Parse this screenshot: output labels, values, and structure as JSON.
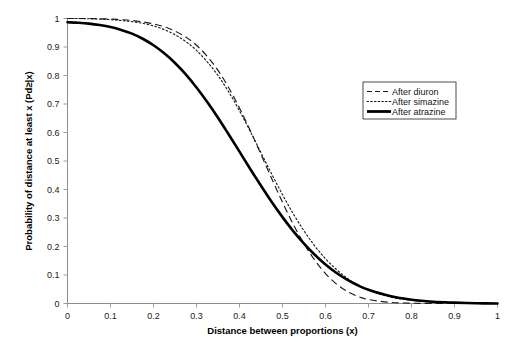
{
  "chart_data": {
    "type": "line",
    "title": "",
    "subtitle": "",
    "xlabel": "Distance between proportions (x)",
    "ylabel": "Probability of distance at least x (Pd≥|x)",
    "xlim": [
      0,
      1
    ],
    "ylim": [
      0,
      1
    ],
    "grid": false,
    "legend_position": "upper-right",
    "xticks": [
      "0",
      "0.1",
      "0.2",
      "0.3",
      "0.4",
      "0.5",
      "0.6",
      "0.7",
      "0.8",
      "0.9",
      "1"
    ],
    "xtick_values": [
      0,
      0.1,
      0.2,
      0.3,
      0.4,
      0.5,
      0.6,
      0.7,
      0.8,
      0.9,
      1
    ],
    "yticks": [
      "0",
      "0.1",
      "0.2",
      "0.3",
      "0.4",
      "0.5",
      "0.6",
      "0.7",
      "0.8",
      "0.9",
      "1"
    ],
    "ytick_values": [
      0,
      0.1,
      0.2,
      0.3,
      0.4,
      0.5,
      0.6,
      0.7,
      0.8,
      0.9,
      1
    ],
    "x": [
      0,
      0.025,
      0.05,
      0.075,
      0.1,
      0.125,
      0.15,
      0.175,
      0.2,
      0.225,
      0.25,
      0.275,
      0.3,
      0.325,
      0.35,
      0.375,
      0.4,
      0.425,
      0.45,
      0.475,
      0.5,
      0.525,
      0.55,
      0.575,
      0.6,
      0.625,
      0.65,
      0.675,
      0.7,
      0.75,
      0.8,
      0.85,
      0.9,
      0.95,
      1
    ],
    "series": [
      {
        "name": "After diuron",
        "style": "dashed",
        "color": "#1b1b1b",
        "values": [
          1.0,
          1.0,
          1.0,
          0.999,
          0.998,
          0.996,
          0.993,
          0.988,
          0.981,
          0.971,
          0.956,
          0.935,
          0.906,
          0.867,
          0.818,
          0.757,
          0.686,
          0.607,
          0.523,
          0.438,
          0.355,
          0.278,
          0.21,
          0.152,
          0.105,
          0.069,
          0.043,
          0.025,
          0.014,
          0.004,
          0.001,
          0.0,
          0.0,
          0.0,
          0.0
        ]
      },
      {
        "name": "After simazine",
        "style": "dotted",
        "color": "#1b1b1b",
        "values": [
          1.0,
          1.0,
          0.999,
          0.998,
          0.996,
          0.993,
          0.989,
          0.983,
          0.974,
          0.961,
          0.943,
          0.919,
          0.888,
          0.848,
          0.8,
          0.742,
          0.676,
          0.604,
          0.529,
          0.454,
          0.382,
          0.315,
          0.255,
          0.202,
          0.157,
          0.12,
          0.089,
          0.065,
          0.047,
          0.023,
          0.011,
          0.005,
          0.002,
          0.001,
          0.0
        ]
      },
      {
        "name": "After atrazine",
        "style": "solid",
        "color": "#000000",
        "values": [
          0.987,
          0.985,
          0.982,
          0.977,
          0.97,
          0.96,
          0.947,
          0.929,
          0.906,
          0.878,
          0.844,
          0.804,
          0.758,
          0.707,
          0.652,
          0.593,
          0.533,
          0.472,
          0.413,
          0.356,
          0.303,
          0.254,
          0.21,
          0.171,
          0.137,
          0.108,
          0.084,
          0.064,
          0.048,
          0.026,
          0.013,
          0.006,
          0.003,
          0.001,
          0.0
        ]
      }
    ]
  },
  "legend": {
    "items": [
      {
        "label": "After diuron"
      },
      {
        "label": "After simazine"
      },
      {
        "label": "After atrazine"
      }
    ]
  }
}
